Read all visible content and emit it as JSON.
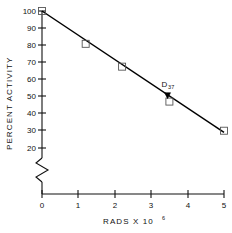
{
  "chart_data": {
    "type": "line",
    "title": "",
    "xlabel": "RADS X 10⁶",
    "ylabel": "PERCENT ACTIVITY",
    "yscale": "log",
    "xscale": "linear",
    "xlim": [
      0,
      5
    ],
    "ylim": [
      20,
      100
    ],
    "grid": false,
    "legend": null,
    "x_ticks": [
      "0",
      "1",
      "2",
      "3",
      "4",
      "5"
    ],
    "x_tick_values": [
      0,
      1,
      2,
      3,
      4,
      5
    ],
    "y_ticks": [
      "100",
      "90",
      "80",
      "70",
      "60",
      "50",
      "40",
      "30",
      "20"
    ],
    "y_tick_values": [
      100,
      90,
      80,
      70,
      60,
      50,
      40,
      30,
      20
    ],
    "axis_break": true,
    "series": [
      {
        "name": "survival",
        "marker": "open-square",
        "x": [
          0.0,
          1.2,
          2.2,
          3.5,
          5.0
        ],
        "values": [
          100,
          68,
          52,
          34.5,
          24.5
        ]
      }
    ],
    "fit_line": {
      "name": "regression",
      "x": [
        0.0,
        5.0
      ],
      "values": [
        100,
        24
      ]
    },
    "annotations": [
      {
        "label": "D",
        "sublabel": "37",
        "marker": "filled",
        "x": 3.45,
        "y": 37
      }
    ]
  },
  "xlabel_parts": {
    "base": "RADS X 10",
    "exponent": "6"
  },
  "yaxis_label": "PERCENT ACTIVITY"
}
